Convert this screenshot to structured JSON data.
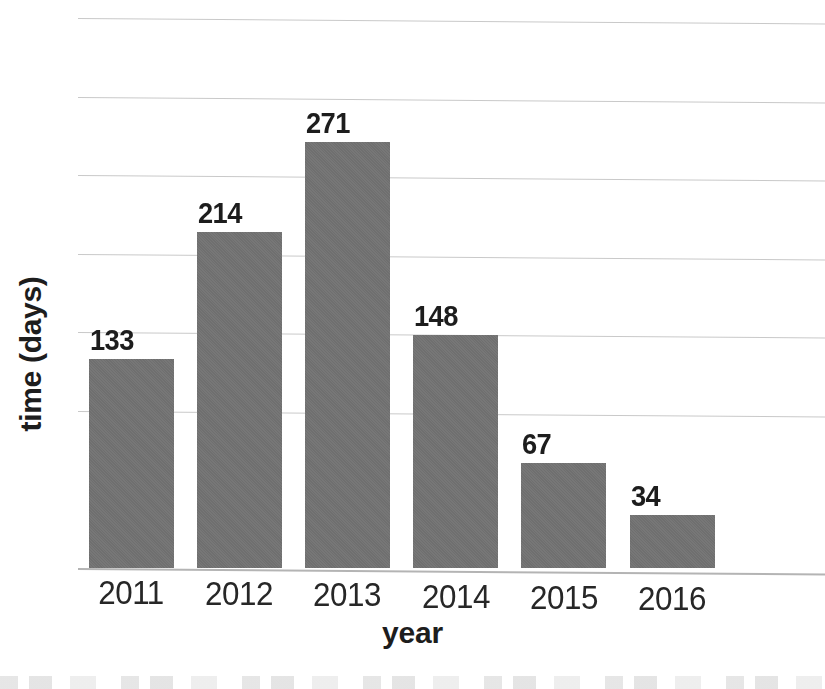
{
  "chart_data": {
    "type": "bar",
    "title": "",
    "xlabel": "year",
    "ylabel": "time (days)",
    "categories": [
      "2011",
      "2012",
      "2013",
      "2014",
      "2015",
      "2016"
    ],
    "values": [
      133,
      214,
      271,
      148,
      67,
      34
    ],
    "value_labels": [
      "133",
      "214",
      "271",
      "148",
      "67",
      "34"
    ],
    "series": [
      {
        "name": "time (days)",
        "values": [
          133,
          214,
          271,
          148,
          67,
          34
        ]
      }
    ],
    "ylim": [
      0,
      350
    ],
    "y_gridline_values": [
      350,
      300,
      250,
      200,
      150,
      100,
      0
    ],
    "grid": true,
    "grid_axis": "y",
    "y_tick_labels_visible": false,
    "legend": false,
    "legend_position": "none",
    "data_labels": true,
    "bar_color": "#6f6f6f",
    "gridline_color": "#c9c9c9",
    "axis_color": "#b4b4b4",
    "text_color": "#1d1d1d",
    "background_color": "#ffffff",
    "annotations": []
  },
  "figure": {
    "name": "bar-chart",
    "background_color": "#ffffff"
  }
}
